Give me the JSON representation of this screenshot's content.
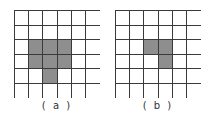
{
  "grid_size": {
    "rows": 6,
    "cols": 6
  },
  "colors": {
    "fill": "#8e8e8e",
    "line": "#3a3a3a",
    "background": "#ffffff"
  },
  "panels": [
    {
      "label": "( a )",
      "filled_cells": [
        [
          2,
          1
        ],
        [
          2,
          2
        ],
        [
          2,
          3
        ],
        [
          3,
          1
        ],
        [
          3,
          2
        ],
        [
          3,
          3
        ],
        [
          4,
          2
        ]
      ]
    },
    {
      "label": "( b )",
      "filled_cells": [
        [
          2,
          2
        ],
        [
          2,
          3
        ],
        [
          3,
          3
        ]
      ]
    }
  ]
}
